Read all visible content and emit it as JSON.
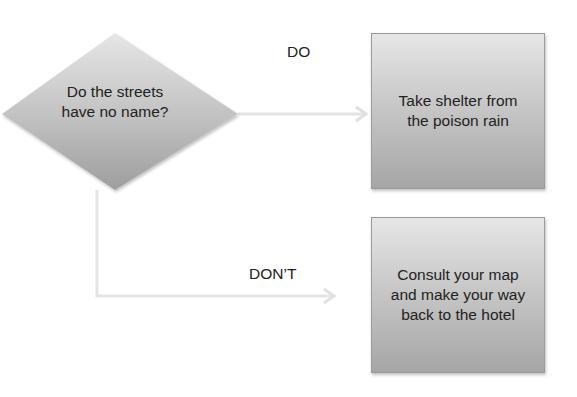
{
  "diagram": {
    "type": "flowchart",
    "decision": {
      "shape": "diamond",
      "text": "Do the streets\nhave no name?",
      "line1": "Do the streets",
      "line2": "have no name?"
    },
    "outcomes": [
      {
        "edge_label": "DO",
        "box_text": "Take shelter from\nthe poison rain"
      },
      {
        "edge_label": "DON’T",
        "box_text": "Consult your map\nand make your way\nback to the hotel"
      }
    ],
    "colors": {
      "shape_fill_top": "#e6e6e6",
      "shape_fill_bottom": "#a6a6a6",
      "connector": "#e4e4e4",
      "text": "#222222",
      "background": "#ffffff"
    }
  }
}
